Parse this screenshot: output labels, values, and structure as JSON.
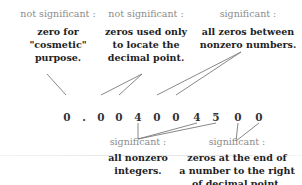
{
  "number_digits": [
    "0",
    ".",
    "0",
    "0",
    "4",
    "0",
    "0",
    "4",
    "5",
    "0",
    "0"
  ],
  "annotations": {
    "top_left": {
      "label": "not significant :",
      "lines": [
        "zero for",
        "\"cosmetic\"",
        "purpose."
      ]
    },
    "top_middle": {
      "label": "not significant :",
      "lines": [
        "zeros used only",
        "to locate the",
        "decimal point."
      ]
    },
    "top_right": {
      "label": "significant :",
      "lines": [
        "all zeros between",
        "nonzero numbers."
      ]
    },
    "bottom_middle": {
      "label": "significant :",
      "lines": [
        "all nonzero",
        "integers."
      ]
    },
    "bottom_right": {
      "label": "significant :",
      "lines": [
        "zeros at the end of",
        "a number to the right",
        "of decimal point."
      ]
    }
  },
  "colors": {
    "label": "#8c8c8c",
    "text": "#222222",
    "line": "#7a7a7a"
  }
}
